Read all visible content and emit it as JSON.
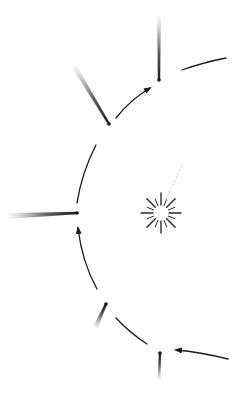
{
  "diagram": {
    "title": "",
    "colors": {
      "background": "#ffffff",
      "ink": "#1a1a1a",
      "tail_light": "#9a9a9a",
      "sun_ray": "#2a2a2a"
    },
    "sun": {
      "cx": 161,
      "cy": 213,
      "inner_r": 7,
      "outer_r": 20,
      "ray_count": 16
    },
    "sun_trace": {
      "x1": 166,
      "y1": 200,
      "x2": 183,
      "y2": 163
    },
    "orbit_segments": [
      {
        "d": "M228,359 Q200,352 176,350",
        "arrow": true
      },
      {
        "d": "M147,344 Q130,333 116,318",
        "arrow": false
      },
      {
        "d": "M97,289 Q82,262 78,228",
        "arrow": true
      },
      {
        "d": "M77,203 Q82,172 96,145",
        "arrow": false
      },
      {
        "d": "M116,118 Q130,100 150,88",
        "arrow": true
      },
      {
        "d": "M182,70 Q205,62 226,58",
        "arrow": false
      }
    ],
    "comets": [
      {
        "name": "comet-bottom",
        "head": [
          160,
          353
        ],
        "tail_end": [
          159,
          380
        ],
        "tail_width": 3
      },
      {
        "name": "comet-lower-left",
        "head": [
          106,
          304
        ],
        "tail_end": [
          95,
          328
        ],
        "tail_width": 5
      },
      {
        "name": "comet-left",
        "head": [
          77,
          213
        ],
        "tail_end": [
          8,
          216
        ],
        "tail_width": 6
      },
      {
        "name": "comet-upper-left",
        "head": [
          109,
          124
        ],
        "tail_end": [
          74,
          66
        ],
        "tail_width": 5
      },
      {
        "name": "comet-top",
        "head": [
          159,
          80
        ],
        "tail_end": [
          159,
          17
        ],
        "tail_width": 4
      }
    ]
  }
}
